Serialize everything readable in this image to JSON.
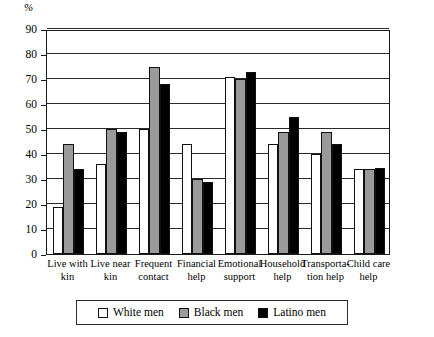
{
  "chart_data": {
    "type": "bar",
    "title": "",
    "subtitle": "",
    "xlabel": "",
    "ylabel": "%",
    "ylim": [
      0,
      90
    ],
    "ytick_step": 10,
    "yticks": [
      0,
      10,
      20,
      30,
      40,
      50,
      60,
      70,
      80,
      90
    ],
    "ytick_labels": [
      "0",
      "10",
      "20",
      "30",
      "40",
      "50",
      "60",
      "70",
      "80",
      "90"
    ],
    "grid": true,
    "grid_axis": "y",
    "legend_position": "bottom",
    "categories": [
      "Live with kin",
      "Live near kin",
      "Frequent contact",
      "Financial help",
      "Emotional support",
      "Household help",
      "Transporta- tion help",
      "Child care help"
    ],
    "category_lines": [
      [
        "Live with",
        "kin"
      ],
      [
        "Live near",
        "kin"
      ],
      [
        "Frequent",
        "contact"
      ],
      [
        "Financial",
        "help"
      ],
      [
        "Emotional",
        "support"
      ],
      [
        "Household",
        "help"
      ],
      [
        "Transporta-",
        "tion help"
      ],
      [
        "Child care",
        "help"
      ]
    ],
    "series": [
      {
        "name": "White men",
        "color": "#ffffff",
        "values": [
          19,
          36,
          50,
          44,
          71,
          44,
          40,
          34
        ]
      },
      {
        "name": "Black men",
        "color": "#9a9a9a",
        "values": [
          44,
          50,
          75,
          30,
          70,
          49,
          49,
          34
        ]
      },
      {
        "name": "Latino men",
        "color": "#000000",
        "values": [
          34,
          49,
          68,
          29,
          73,
          55,
          44,
          34.5
        ]
      }
    ]
  },
  "legend": {
    "items": [
      {
        "label": "White men",
        "swatch": "white"
      },
      {
        "label": "Black men",
        "swatch": "gray"
      },
      {
        "label": "Latino men",
        "swatch": "black"
      }
    ]
  },
  "axis": {
    "y_unit_label": "%"
  }
}
